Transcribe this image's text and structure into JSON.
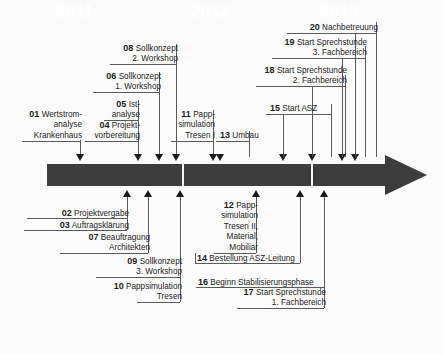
{
  "diagram": {
    "axis": {
      "years": [
        "2011",
        "2012",
        "2013"
      ],
      "bar_color": "#3d3d3d",
      "text_color": "#ffffff"
    },
    "events_above": [
      {
        "num": "01",
        "text": "Wertstrom-\nanalyse\nKrankenhaus"
      },
      {
        "num": "04",
        "text": "Projekt-\nvorbereitung"
      },
      {
        "num": "05",
        "text": "Ist-\nanalyse"
      },
      {
        "num": "06",
        "text": "Sollkonzept\n1. Workshop"
      },
      {
        "num": "08",
        "text": "Sollkonzept\n2. Workshop"
      },
      {
        "num": "11",
        "text": "Papp-\nsimulation\nTresen I"
      },
      {
        "num": "13",
        "text": "Umbau"
      },
      {
        "num": "15",
        "text": "Start ASZ"
      },
      {
        "num": "18",
        "text": "Start Sprechstunde\n2.  Fachbereich"
      },
      {
        "num": "19",
        "text": "Start Sprechstunde\n3. Fachbereich"
      },
      {
        "num": "20",
        "text": "Nachbetreuung"
      }
    ],
    "events_below": [
      {
        "num": "02",
        "text": "Projektvergabe"
      },
      {
        "num": "03",
        "text": "Auftragsklärung"
      },
      {
        "num": "07",
        "text": "Beauftragung\nArchitekten"
      },
      {
        "num": "09",
        "text": "Sollkonzept\n3. Workshop"
      },
      {
        "num": "10",
        "text": "Pappsimulation\nTresen"
      },
      {
        "num": "12",
        "text": "Papp-\nsimulation\nTresen II,\nMaterial,\nMobiliar"
      },
      {
        "num": "14",
        "text": "Bestellung ASZ-Leitung"
      },
      {
        "num": "16",
        "text": "Beginn Stabilisierungsphase"
      },
      {
        "num": "17",
        "text": "Start Sprechstunde\n1. Fachbereich"
      }
    ]
  }
}
